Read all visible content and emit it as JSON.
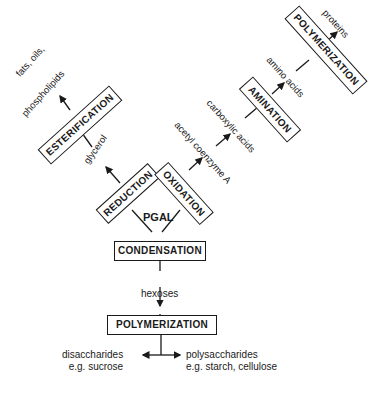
{
  "diagram": {
    "processes": {
      "esterification": "ESTERIFICATION",
      "reduction": "REDUCTION",
      "oxidation": "OXIDATION",
      "amination": "AMINATION",
      "polymerization_top": "POLYMERIZATION",
      "condensation": "CONDENSATION",
      "polymerization_bottom": "POLYMERIZATION"
    },
    "products": {
      "fats_line1": "fats, oils,",
      "fats_line2": "phospholipids",
      "glycerol": "glycerol",
      "acetyl": "acetyl coenzyme A",
      "carboxylic": "carboxylic acids",
      "amino": "amino acids",
      "proteins": "proteins",
      "pgal": "PGAL",
      "hexoses": "hexoses",
      "disaccharides_line1": "disaccharides",
      "disaccharides_line2": "e.g. sucrose",
      "polysaccharides_line1": "polysaccharides",
      "polysaccharides_line2": "e.g. starch, cellulose"
    },
    "colors": {
      "ink": "#1a1a1a",
      "background": "#ffffff"
    }
  }
}
